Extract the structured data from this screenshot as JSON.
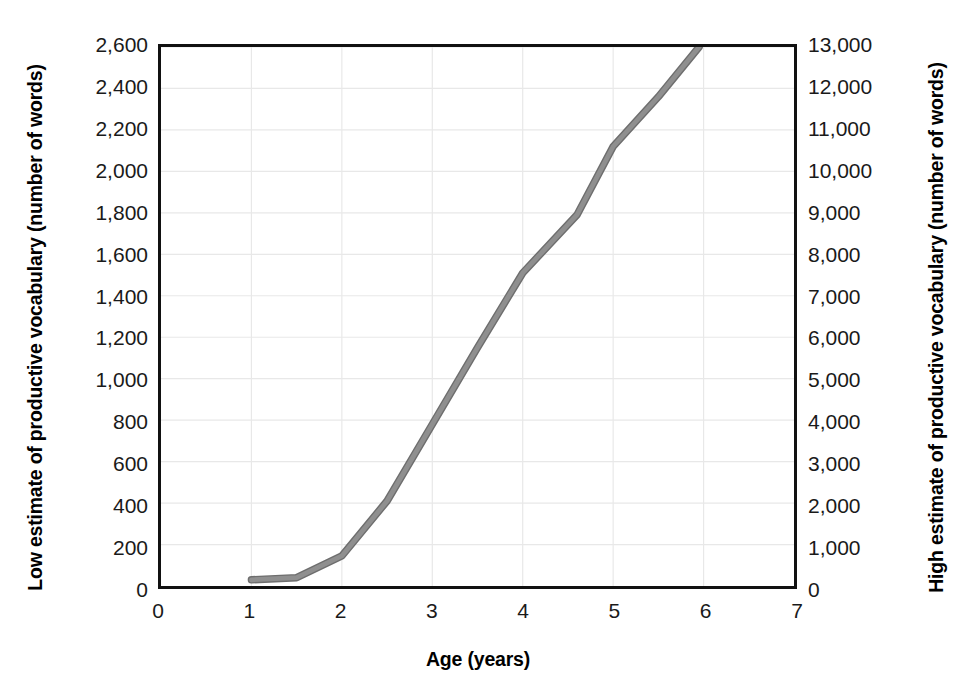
{
  "chart_data": {
    "type": "line",
    "title": "",
    "subtitle": "",
    "xlabel": "Age (years)",
    "ylabel": "Low estimate of productive vocabulary (number of words)",
    "y2label": "High estimate of productive vocabulary (number of words)",
    "xlim": [
      0,
      7
    ],
    "ylim": [
      0,
      2600
    ],
    "y2lim": [
      0,
      13000
    ],
    "xticks": [
      "0",
      "1",
      "2",
      "3",
      "4",
      "5",
      "6",
      "7"
    ],
    "xtick_values": [
      0,
      1,
      2,
      3,
      4,
      5,
      6,
      7
    ],
    "yticks": [
      "0",
      "200",
      "400",
      "600",
      "800",
      "1,000",
      "1,200",
      "1,400",
      "1,600",
      "1,800",
      "2,000",
      "2,200",
      "2,400",
      "2,600"
    ],
    "ytick_values": [
      0,
      200,
      400,
      600,
      800,
      1000,
      1200,
      1400,
      1600,
      1800,
      2000,
      2200,
      2400,
      2600
    ],
    "y2ticks": [
      "0",
      "1,000",
      "2,000",
      "3,000",
      "4,000",
      "5,000",
      "6,000",
      "7,000",
      "8,000",
      "9,000",
      "10,000",
      "11,000",
      "12,000",
      "13,000"
    ],
    "y2tick_values": [
      0,
      1000,
      2000,
      3000,
      4000,
      5000,
      6000,
      7000,
      8000,
      9000,
      10000,
      11000,
      12000,
      13000
    ],
    "grid": true,
    "grid_color": "#e8e8e8",
    "legend": "none",
    "line_color": "#8f8f8f",
    "line_width": 6,
    "series": [
      {
        "name": "Productive vocabulary growth",
        "x": [
          1.0,
          1.5,
          2.0,
          2.5,
          3.0,
          3.5,
          4.0,
          4.6,
          5.0,
          5.5,
          5.95
        ],
        "values": [
          30,
          40,
          145,
          410,
          780,
          1150,
          1510,
          1790,
          2120,
          2360,
          2600
        ],
        "x_high": [
          1.0,
          1.5,
          2.0,
          2.5,
          3.0,
          3.5,
          4.0,
          4.6,
          5.0,
          5.5,
          5.95
        ],
        "values_high": [
          150,
          200,
          725,
          2050,
          3900,
          5750,
          7550,
          8950,
          10600,
          11800,
          13000
        ]
      }
    ]
  },
  "axes": {
    "x_title": "Age (years)",
    "y_left_title": "Low estimate of productive vocabulary (number of words)",
    "y_right_title": "High estimate of productive vocabulary (number of words)"
  }
}
